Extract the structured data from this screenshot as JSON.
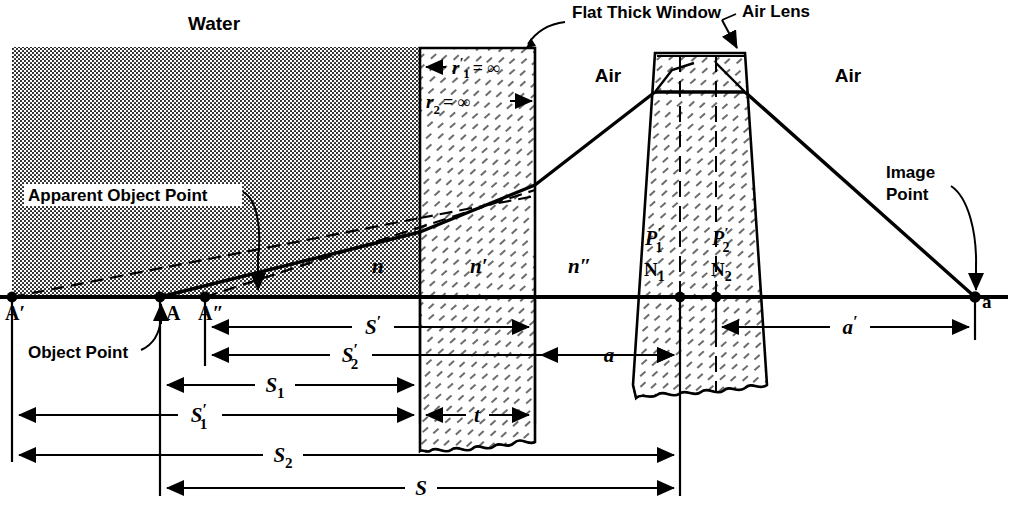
{
  "figure": {
    "type": "optical-ray-diagram",
    "background_color": "#ffffff",
    "ink_color": "#000000"
  },
  "media_labels": {
    "water": "Water",
    "air_left": "Air",
    "air_right": "Air"
  },
  "component_labels": {
    "window": "Flat Thick Window",
    "lens": "Air Lens"
  },
  "annotation_labels": {
    "apparent_object_point": "Apparent Object Point",
    "object_point": "Object Point",
    "image_point_line1": "Image",
    "image_point_line2": "Point"
  },
  "radii": {
    "r1": "r",
    "r1_sup": "′",
    "r1_sub": "1",
    "r1_value": "= ∞",
    "r2": "r",
    "r2_sub": "2",
    "r2_value": "= ∞"
  },
  "indices": {
    "n": "n",
    "n_prime": "n′",
    "n_double_prime": "n″"
  },
  "axis_points": [
    {
      "name": "A-prime",
      "label": "A′",
      "x": 12
    },
    {
      "name": "A",
      "label": "A",
      "x": 160
    },
    {
      "name": "A-double-prime",
      "label": "A″",
      "x": 205
    },
    {
      "name": "N1",
      "label": "N",
      "sub": "1",
      "x": 680
    },
    {
      "name": "N2",
      "label": "N",
      "sub": "2",
      "x": 716
    },
    {
      "name": "a",
      "label": "a",
      "x": 975
    }
  ],
  "cardinal_points": [
    {
      "name": "P1-prime",
      "base": "P",
      "sup": "′",
      "sub": "1"
    },
    {
      "name": "P2-prime",
      "base": "P",
      "sup": "′",
      "sub": "2"
    }
  ],
  "dimensions": [
    {
      "name": "S-prime",
      "base": "S",
      "sup": "′",
      "sub": "",
      "y": 327,
      "x1": 205,
      "x2": 535,
      "arrows": "both"
    },
    {
      "name": "S2-prime",
      "base": "S",
      "sup": "′",
      "sub": "2",
      "y": 355,
      "x1": 205,
      "x2": 680,
      "arrows": "both"
    },
    {
      "name": "S1",
      "base": "S",
      "sup": "",
      "sub": "1",
      "y": 385,
      "x1": 160,
      "x2": 420,
      "arrows": "both"
    },
    {
      "name": "S1-prime",
      "base": "S",
      "sup": "′",
      "sub": "1",
      "y": 415,
      "x1": 12,
      "x2": 420,
      "arrows": "both"
    },
    {
      "name": "S2",
      "base": "S",
      "sup": "",
      "sub": "2",
      "y": 455,
      "x1": 12,
      "x2": 680,
      "arrows": "both"
    },
    {
      "name": "S",
      "base": "S",
      "sup": "",
      "sub": "",
      "y": 488,
      "x1": 160,
      "x2": 680,
      "arrows": "both"
    },
    {
      "name": "t",
      "base": "t",
      "sup": "",
      "sub": "",
      "y": 415,
      "x1": 420,
      "x2": 535,
      "arrows": "both"
    },
    {
      "name": "a",
      "base": "a",
      "sup": "",
      "sub": "",
      "y": 355,
      "x1": 535,
      "x2": 680,
      "arrows": "both"
    },
    {
      "name": "a-prime",
      "base": "a",
      "sup": "′",
      "sub": "",
      "y": 327,
      "x1": 716,
      "x2": 975,
      "arrows": "both"
    }
  ],
  "geometry": {
    "axis_y": 297,
    "water_region": {
      "x": 12,
      "y": 47,
      "width": 408,
      "height": 250
    },
    "window": {
      "x_left": 420,
      "x_right": 535,
      "y_top": 48,
      "y_bottom": 450
    },
    "lens": {
      "top_left": 655,
      "top_right": 745,
      "top_y": 53,
      "bottom_left": 633,
      "bottom_right": 767,
      "bottom_y": 400
    },
    "image_point": {
      "x": 975,
      "y": 297
    }
  }
}
